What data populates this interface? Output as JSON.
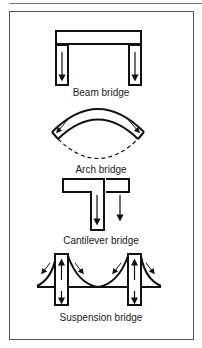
{
  "diagram": {
    "bridges": [
      {
        "id": "beam",
        "label": "Beam bridge"
      },
      {
        "id": "arch",
        "label": "Arch bridge"
      },
      {
        "id": "cantilever",
        "label": "Cantilever bridge"
      },
      {
        "id": "suspension",
        "label": "Suspension bridge"
      }
    ],
    "colors": {
      "stroke": "#111111",
      "background": "#ffffff",
      "frame": "#555555"
    }
  }
}
